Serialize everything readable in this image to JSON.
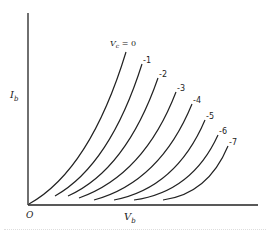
{
  "figure": {
    "y_axis_label": "I",
    "y_axis_sub": "b",
    "x_axis_label": "V",
    "x_axis_sub": "b",
    "origin_label": "O",
    "family_param_label": "V",
    "family_param_sub": "c",
    "family_param_eq": " = 0"
  },
  "curves": [
    {
      "label": "V_c = 0",
      "tag": "",
      "start": [
        29,
        204
      ],
      "ctrl": [
        90,
        170
      ],
      "end": [
        126,
        52
      ]
    },
    {
      "label": "-1",
      "tag": "-1",
      "start": [
        55,
        196
      ],
      "ctrl": [
        110,
        165
      ],
      "end": [
        142,
        64
      ]
    },
    {
      "label": "-2",
      "tag": "-2",
      "start": [
        68,
        196
      ],
      "ctrl": [
        126,
        170
      ],
      "end": [
        158,
        78
      ]
    },
    {
      "label": "-3",
      "tag": "-3",
      "start": [
        79,
        198
      ],
      "ctrl": [
        144,
        175
      ],
      "end": [
        176,
        92
      ]
    },
    {
      "label": "-4",
      "tag": "-4",
      "start": [
        94,
        200
      ],
      "ctrl": [
        160,
        182
      ],
      "end": [
        192,
        104
      ]
    },
    {
      "label": "-5",
      "tag": "-5",
      "start": [
        114,
        200
      ],
      "ctrl": [
        176,
        188
      ],
      "end": [
        205,
        120
      ]
    },
    {
      "label": "-6",
      "tag": "-6",
      "start": [
        134,
        200
      ],
      "ctrl": [
        192,
        192
      ],
      "end": [
        218,
        135
      ]
    },
    {
      "label": "-7",
      "tag": "-7",
      "start": [
        163,
        200
      ],
      "ctrl": [
        208,
        194
      ],
      "end": [
        228,
        146
      ]
    }
  ],
  "colors": {
    "ink": "#222222",
    "background": "#ffffff"
  }
}
